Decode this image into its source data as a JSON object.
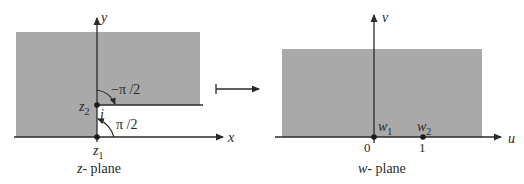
{
  "z_plane": {
    "caption_var": "z",
    "caption_rest": "- plane",
    "x_axis_label": "x",
    "y_axis_label": "y",
    "point_z1": {
      "name": "z",
      "sub": "1"
    },
    "point_z2": {
      "name": "z",
      "sub": "2"
    },
    "point_i_label": "i",
    "angle_upper": "−π /2",
    "angle_lower": "π /2"
  },
  "mapping_arrow": "maps-to",
  "w_plane": {
    "caption_var": "w",
    "caption_rest": "- plane",
    "u_axis_label": "u",
    "v_axis_label": "v",
    "point_w1": {
      "name": "w",
      "sub": "1"
    },
    "point_w2": {
      "name": "w",
      "sub": "2"
    },
    "tick_0": "0",
    "tick_1": "1"
  },
  "colors": {
    "region_fill": "#a9a9a9",
    "line": "#2a2a2a",
    "background": "#ffffff"
  }
}
